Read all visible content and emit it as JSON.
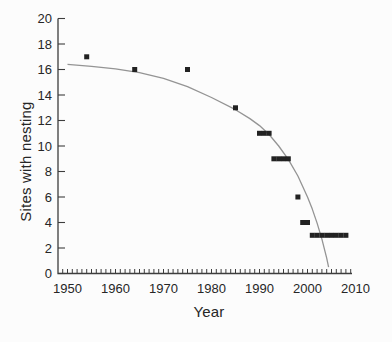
{
  "figure": {
    "background": "#fcfcfc",
    "axis_color": "#3d3d3d",
    "text_color": "#262626",
    "marker_color": "#222222",
    "curve_color": "#949494"
  },
  "chart_data": {
    "type": "scatter",
    "title": "",
    "xlabel": "Year",
    "ylabel": "Sites with nesting",
    "xlim": [
      1948,
      2011
    ],
    "ylim": [
      0,
      20
    ],
    "grid": false,
    "legend": null,
    "marker": "square",
    "x_tick_labels": [
      1950,
      1960,
      1970,
      1980,
      1990,
      2000,
      2010
    ],
    "x_minor_ticks": {
      "start": 1949,
      "end": 2009,
      "step": 1
    },
    "y_ticks": [
      0,
      2,
      4,
      6,
      8,
      10,
      12,
      14,
      16,
      18,
      20
    ],
    "points": [
      [
        1954,
        17
      ],
      [
        1964,
        16
      ],
      [
        1975,
        16
      ],
      [
        1985,
        13
      ],
      [
        1990,
        11
      ],
      [
        1991,
        11
      ],
      [
        1992,
        11
      ],
      [
        1993,
        9
      ],
      [
        1994,
        9
      ],
      [
        1995,
        9
      ],
      [
        1996,
        9
      ],
      [
        1998,
        6
      ],
      [
        1999,
        4
      ],
      [
        2000,
        4
      ],
      [
        2001,
        3
      ],
      [
        2002,
        3
      ],
      [
        2003,
        3
      ],
      [
        2004,
        3
      ],
      [
        2005,
        3
      ],
      [
        2006,
        3
      ],
      [
        2007,
        3
      ],
      [
        2008,
        3
      ]
    ],
    "fitted_curve": [
      [
        1950,
        16.4
      ],
      [
        1955,
        16.25
      ],
      [
        1960,
        16.05
      ],
      [
        1965,
        15.75
      ],
      [
        1970,
        15.3
      ],
      [
        1975,
        14.65
      ],
      [
        1980,
        13.8
      ],
      [
        1985,
        12.85
      ],
      [
        1988,
        12.15
      ],
      [
        1990,
        11.6
      ],
      [
        1992,
        10.9
      ],
      [
        1994,
        10.0
      ],
      [
        1996,
        8.95
      ],
      [
        1998,
        7.65
      ],
      [
        2000,
        6.0
      ],
      [
        2001,
        5.05
      ],
      [
        2002,
        3.95
      ],
      [
        2003,
        2.7
      ],
      [
        2004,
        1.2
      ],
      [
        2004.4,
        0.5
      ]
    ]
  }
}
